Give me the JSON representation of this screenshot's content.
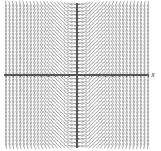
{
  "figure": {
    "width": 161,
    "height": 151,
    "background_color": "#ffffff",
    "caption": "Slope field for dy/dx = x"
  },
  "axes": {
    "color": "#555555",
    "origin_px": {
      "x": 77,
      "y": 75
    },
    "x_axis": {
      "label": "x",
      "label_position": "right-end",
      "start_px": 4,
      "end_px": 148,
      "tick_spacing_px": 7.1,
      "tick_length_px": 3
    },
    "y_axis": {
      "label": "",
      "start_px": 3,
      "end_px": 148,
      "tick_spacing_px": 7.1,
      "tick_length_px": 3
    }
  },
  "chart_data": {
    "type": "scatter",
    "subtype": "slope-field",
    "title": "",
    "subtitle": "",
    "xlabel": "x",
    "ylabel": "",
    "grid": false,
    "legend": null,
    "equation": "dy/dx = x",
    "xlim": [
      -5.15,
      5.0
    ],
    "ylim": [
      -5.3,
      5.3
    ],
    "grid_columns": 21,
    "grid_rows": 22,
    "sample_x": [
      -5.0,
      -4.5,
      -4.0,
      -3.5,
      -3.0,
      -2.5,
      -2.0,
      -1.5,
      -1.0,
      -0.5,
      0.0,
      0.5,
      1.0,
      1.5,
      2.0,
      2.5,
      3.0,
      3.5,
      4.0,
      4.5,
      5.0
    ],
    "sample_y": [
      -5.0,
      -4.5,
      -4.0,
      -3.5,
      -3.0,
      -2.5,
      -2.0,
      -1.5,
      -1.0,
      -0.5,
      0.0,
      0.5,
      1.0,
      1.5,
      2.0,
      2.5,
      3.0,
      3.5,
      4.0,
      4.5,
      5.0
    ],
    "slope_values_by_x": [
      -5.0,
      -4.5,
      -4.0,
      -3.5,
      -3.0,
      -2.5,
      -2.0,
      -1.5,
      -1.0,
      -0.5,
      0.0,
      0.5,
      1.0,
      1.5,
      2.0,
      2.5,
      3.0,
      3.5,
      4.0,
      4.5,
      5.0
    ],
    "dash_color": "#9a9a9a",
    "dash_length_px": 6.0,
    "dash_spacing_px": 7.1,
    "pixels_per_unit_x": 7.1,
    "pixels_per_unit_y": 7.1,
    "slope_display_scale": 0.42
  }
}
